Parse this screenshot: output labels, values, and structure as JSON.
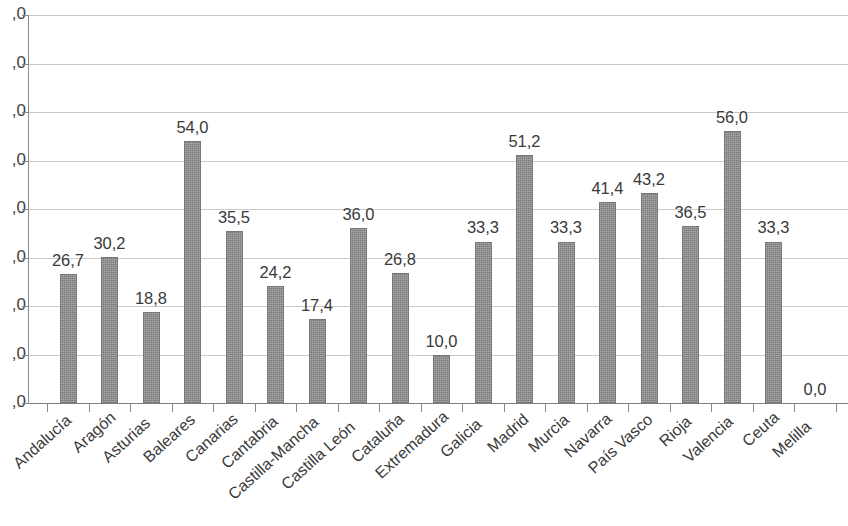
{
  "chart_data": {
    "type": "bar",
    "title": "",
    "subtitle": "",
    "xlabel": "",
    "ylabel": "",
    "ylim": [
      0,
      80
    ],
    "yticks": [
      0,
      10,
      20,
      30,
      40,
      50,
      60,
      70,
      80
    ],
    "ytick_labels_visible": [
      ",0",
      ",0",
      ",0",
      ",0",
      ",0",
      ",0",
      ",0",
      ",0",
      ",0"
    ],
    "ytick_labels_note": "y-axis tick labels are cropped at the left edge of the image; only the trailing \",0\" of each is rendered",
    "grid": true,
    "legend": null,
    "legend_position": "none",
    "decimal_separator": ",",
    "bar_color": "#8c8c8c",
    "gridline_color": "#c9c9c9",
    "axis_color": "#8a8a8a",
    "label_color": "#3a3a3a",
    "categories": [
      "Andalucía",
      "Aragón",
      "Asturias",
      "Baleares",
      "Canarias",
      "Cantabria",
      "Castilla-Mancha",
      "Castilla León",
      "Cataluña",
      "Extremadura",
      "Galicia",
      "Madrid",
      "Murcia",
      "Navarra",
      "País Vasco",
      "Rioja",
      "Valencia",
      "Ceuta",
      "Melilla"
    ],
    "values": [
      26.7,
      30.2,
      18.8,
      54.0,
      35.5,
      24.2,
      17.4,
      36.0,
      26.8,
      10.0,
      33.3,
      51.2,
      33.3,
      41.4,
      43.2,
      36.5,
      56.0,
      33.3,
      0.0
    ],
    "value_labels": [
      "26,7",
      "30,2",
      "18,8",
      "54,0",
      "35,5",
      "24,2",
      "17,4",
      "36,0",
      "26,8",
      "10,0",
      "33,3",
      "51,2",
      "33,3",
      "41,4",
      "43,2",
      "36,5",
      "56,0",
      "33,3",
      "0,0"
    ]
  }
}
